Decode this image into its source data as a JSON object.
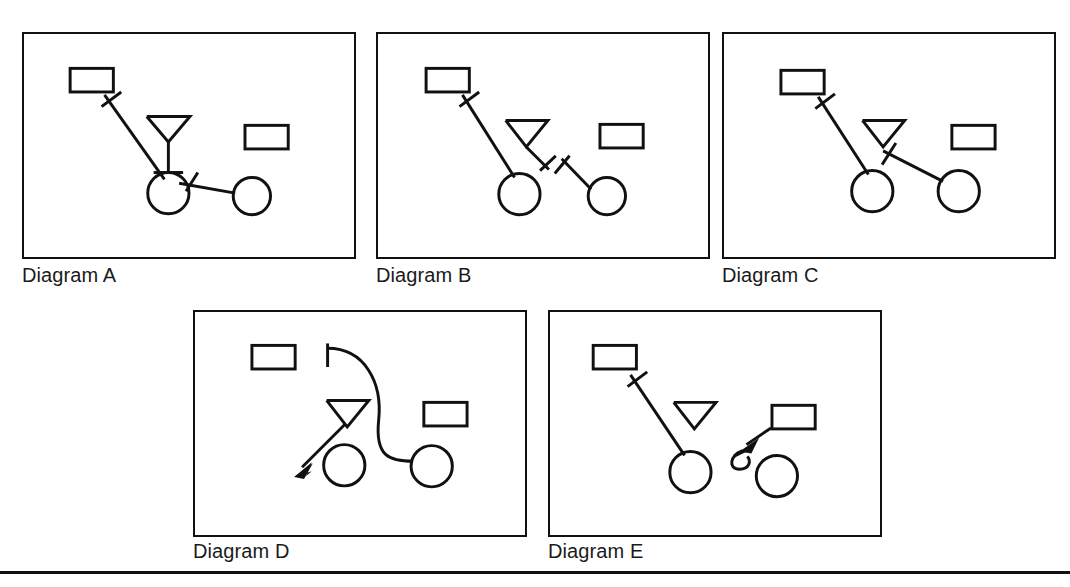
{
  "page": {
    "width": 1070,
    "height": 587,
    "background": "#ffffff",
    "ink_color": "#111111",
    "ghost_text_top": "",
    "bottom_rule": true
  },
  "captions": {
    "a": "Diagram A",
    "b": "Diagram B",
    "c": "Diagram C",
    "d": "Diagram D",
    "e": "Diagram E"
  },
  "diagram_data": {
    "type": "schematic-diagram-set",
    "description": "Five boxed line drawings labelled Diagram A through Diagram E, each containing rectangles, circles, a downward-pointing triangle, and connector lines bearing tick marks or arrowheads.",
    "panel_size": {
      "width": 334,
      "height": 227
    },
    "panels": [
      {
        "id": "a",
        "label": "Diagram A",
        "origin": {
          "x": 22,
          "y": 32
        },
        "nodes": [
          {
            "name": "rectangle-top-left",
            "shape": "rectangle",
            "x": 46,
            "y": 35,
            "w": 44,
            "h": 24
          },
          {
            "name": "rectangle-right",
            "shape": "rectangle",
            "x": 224,
            "y": 93,
            "w": 44,
            "h": 24
          },
          {
            "name": "triangle-center",
            "shape": "triangle-down-with-stem",
            "x": 144,
            "y": 85
          },
          {
            "name": "circle-left",
            "shape": "circle",
            "cx": 146,
            "cy": 162,
            "r": 20
          },
          {
            "name": "circle-right",
            "shape": "circle",
            "cx": 231,
            "cy": 165,
            "r": 19
          }
        ],
        "connectors": [
          {
            "name": "connector-rect-to-circle",
            "from": "rectangle-top-left",
            "to": "circle-left",
            "style": "straight",
            "tick": "near-source"
          },
          {
            "name": "connector-circle-to-circle",
            "from": "circle-left",
            "to": "circle-right",
            "style": "straight",
            "tick": "near-source"
          }
        ]
      },
      {
        "id": "b",
        "label": "Diagram B",
        "origin": {
          "x": 376,
          "y": 32
        },
        "nodes": [
          {
            "name": "rectangle-top-left",
            "shape": "rectangle",
            "x": 48,
            "y": 35,
            "w": 44,
            "h": 24
          },
          {
            "name": "rectangle-right",
            "shape": "rectangle",
            "x": 225,
            "y": 92,
            "w": 44,
            "h": 24
          },
          {
            "name": "triangle-center",
            "shape": "triangle-down",
            "x": 130,
            "y": 89
          },
          {
            "name": "circle-left",
            "shape": "circle",
            "cx": 143,
            "cy": 163,
            "r": 20
          },
          {
            "name": "circle-right",
            "shape": "circle",
            "cx": 232,
            "cy": 165,
            "r": 19
          }
        ],
        "connectors": [
          {
            "name": "connector-rect-to-circle",
            "from": "rectangle-top-left",
            "to": "circle-left",
            "style": "straight",
            "tick": "near-source"
          },
          {
            "name": "connector-triangle-dangling",
            "from": "triangle-center",
            "to": "free-end",
            "style": "straight",
            "tick": "at-end"
          },
          {
            "name": "connector-dangling-to-circle",
            "from": "free-start",
            "to": "circle-right",
            "style": "straight",
            "tick": "at-start"
          }
        ]
      },
      {
        "id": "c",
        "label": "Diagram C",
        "origin": {
          "x": 722,
          "y": 32
        },
        "nodes": [
          {
            "name": "rectangle-top-left",
            "shape": "rectangle",
            "x": 57,
            "y": 37,
            "w": 44,
            "h": 24
          },
          {
            "name": "rectangle-right",
            "shape": "rectangle",
            "x": 231,
            "y": 93,
            "w": 44,
            "h": 24
          },
          {
            "name": "triangle-center",
            "shape": "triangle-down",
            "x": 141,
            "y": 90
          },
          {
            "name": "circle-left",
            "shape": "circle",
            "cx": 150,
            "cy": 160,
            "r": 20
          },
          {
            "name": "circle-right",
            "shape": "circle",
            "cx": 238,
            "cy": 160,
            "r": 20
          }
        ],
        "connectors": [
          {
            "name": "connector-rect-to-circle",
            "from": "rectangle-top-left",
            "to": "circle-left",
            "style": "straight",
            "tick": "near-source"
          },
          {
            "name": "connector-triangle-to-circle",
            "from": "triangle-center",
            "to": "circle-right",
            "style": "straight",
            "tick": "near-source"
          }
        ]
      },
      {
        "id": "d",
        "label": "Diagram D",
        "origin": {
          "x": 193,
          "y": 310
        },
        "nodes": [
          {
            "name": "rectangle-top-left",
            "shape": "rectangle",
            "x": 57,
            "y": 34,
            "w": 44,
            "h": 24
          },
          {
            "name": "rectangle-right",
            "shape": "rectangle",
            "x": 232,
            "y": 92,
            "w": 44,
            "h": 24
          },
          {
            "name": "triangle-center",
            "shape": "triangle-down",
            "x": 134,
            "y": 90
          },
          {
            "name": "circle-left",
            "shape": "circle",
            "cx": 151,
            "cy": 156,
            "r": 20
          },
          {
            "name": "circle-right",
            "shape": "circle",
            "cx": 240,
            "cy": 157,
            "r": 20
          }
        ],
        "connectors": [
          {
            "name": "connector-curved-s",
            "from": "free-start",
            "to": "circle-right",
            "style": "s-curve",
            "tick": "at-start"
          },
          {
            "name": "connector-arrow-from-triangle",
            "from": "triangle-center",
            "to": "free-end",
            "style": "straight",
            "arrow": "at-end"
          }
        ]
      },
      {
        "id": "e",
        "label": "Diagram E",
        "origin": {
          "x": 548,
          "y": 310
        },
        "nodes": [
          {
            "name": "rectangle-top-left",
            "shape": "rectangle",
            "x": 43,
            "y": 34,
            "w": 44,
            "h": 24
          },
          {
            "name": "rectangle-right",
            "shape": "rectangle",
            "x": 225,
            "y": 95,
            "w": 44,
            "h": 24
          },
          {
            "name": "triangle-center",
            "shape": "triangle-down",
            "x": 129,
            "y": 93
          },
          {
            "name": "circle-left",
            "shape": "circle",
            "cx": 142,
            "cy": 163,
            "r": 20
          },
          {
            "name": "circle-right",
            "shape": "circle",
            "cx": 230,
            "cy": 167,
            "r": 20
          }
        ],
        "connectors": [
          {
            "name": "connector-rect-to-circle",
            "from": "rectangle-top-left",
            "to": "circle-left",
            "style": "straight",
            "tick": "near-source"
          },
          {
            "name": "connector-arrow-rect-to-hook",
            "from": "rectangle-right",
            "to": "hook",
            "style": "straight",
            "arrow": "at-end"
          },
          {
            "name": "connector-hook",
            "from": "arrow-tip",
            "to": "circle-right",
            "style": "hook-curve",
            "tick": "on-hook"
          }
        ]
      }
    ]
  }
}
